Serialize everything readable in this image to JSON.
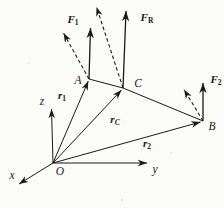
{
  "figure": {
    "colors": {
      "ink": "#1a1a1a",
      "background": "#fbfbf8"
    },
    "axes": {
      "x": "x",
      "y": "y",
      "z": "z"
    },
    "points": {
      "O": "O",
      "A": "A",
      "B": "B",
      "C": "C"
    },
    "vectors": {
      "f1": {
        "main": "F",
        "sub": "1"
      },
      "fr": {
        "main": "F",
        "sub": "R"
      },
      "f2": {
        "main": "F",
        "sub": "2"
      },
      "r1": {
        "main": "r",
        "sub": "1"
      },
      "rc": {
        "main": "r",
        "sub": "C"
      },
      "r2": {
        "main": "r",
        "sub": "2"
      }
    }
  }
}
